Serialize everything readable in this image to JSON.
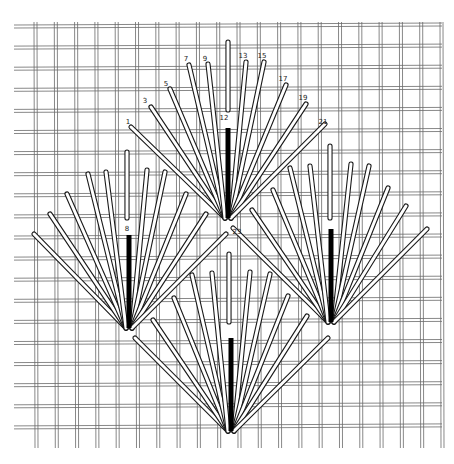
{
  "diagram": {
    "type": "needlepoint-fan-stitch",
    "colors": {
      "canvas": "#ffffff",
      "mesh": "#6a6a6a",
      "stitch_outline": "#1a1a1a",
      "stitch_fill": "#ffffff",
      "center_bar": "#000000"
    },
    "labels": [
      {
        "text": "1",
        "x": 128,
        "y": 124
      },
      {
        "text": "3",
        "x": 145,
        "y": 103
      },
      {
        "text": "5",
        "x": 166,
        "y": 86
      },
      {
        "text": "7",
        "x": 186,
        "y": 61
      },
      {
        "text": "9",
        "x": 205,
        "y": 61
      },
      {
        "text": "12",
        "x": 224,
        "y": 120
      },
      {
        "text": "13",
        "x": 243,
        "y": 58
      },
      {
        "text": "15",
        "x": 262,
        "y": 58
      },
      {
        "text": "17",
        "x": 283,
        "y": 81
      },
      {
        "text": "19",
        "x": 303,
        "y": 100
      },
      {
        "text": "21",
        "x": 323,
        "y": 124
      },
      {
        "text": "8",
        "x": 127,
        "y": 231
      },
      {
        "text": "23",
        "x": 237,
        "y": 234
      }
    ],
    "fans": [
      {
        "name": "top-fan",
        "base": [
          228,
          220
        ],
        "white_vertical": [
          [
            228,
            42
          ],
          [
            228,
            110
          ]
        ],
        "center_bar": [
          [
            228,
            128
          ],
          [
            228,
            218
          ]
        ],
        "tops": [
          [
            131,
            127
          ],
          [
            151,
            107
          ],
          [
            170,
            89
          ],
          [
            189,
            65
          ],
          [
            208,
            64
          ],
          [
            246,
            62
          ],
          [
            264,
            62
          ],
          [
            286,
            85
          ],
          [
            306,
            104
          ],
          [
            325,
            124
          ]
        ]
      },
      {
        "name": "left-fan",
        "base": [
          129,
          330
        ],
        "white_vertical": [
          [
            127,
            152
          ],
          [
            127,
            218
          ]
        ],
        "center_bar": [
          [
            129,
            235
          ],
          [
            129,
            328
          ]
        ],
        "tops": [
          [
            34,
            234
          ],
          [
            50,
            214
          ],
          [
            67,
            194
          ],
          [
            88,
            174
          ],
          [
            106,
            172
          ],
          [
            147,
            170
          ],
          [
            165,
            172
          ],
          [
            186,
            194
          ],
          [
            206,
            214
          ],
          [
            226,
            234
          ]
        ]
      },
      {
        "name": "right-fan",
        "base": [
          331,
          324
        ],
        "white_vertical": [
          [
            330,
            146
          ],
          [
            330,
            218
          ]
        ],
        "center_bar": [
          [
            331,
            229
          ],
          [
            331,
            322
          ]
        ],
        "tops": [
          [
            233,
            228
          ],
          [
            252,
            210
          ],
          [
            273,
            190
          ],
          [
            290,
            168
          ],
          [
            310,
            166
          ],
          [
            351,
            164
          ],
          [
            369,
            166
          ],
          [
            388,
            188
          ],
          [
            406,
            206
          ],
          [
            427,
            229
          ]
        ]
      },
      {
        "name": "bottom-fan",
        "base": [
          231,
          433
        ],
        "white_vertical": [
          [
            229,
            254
          ],
          [
            229,
            322
          ]
        ],
        "center_bar": [
          [
            231,
            338
          ],
          [
            231,
            431
          ]
        ],
        "tops": [
          [
            135,
            338
          ],
          [
            153,
            320
          ],
          [
            174,
            298
          ],
          [
            192,
            275
          ],
          [
            212,
            273
          ],
          [
            250,
            272
          ],
          [
            270,
            274
          ],
          [
            288,
            296
          ],
          [
            307,
            316
          ],
          [
            328,
            338
          ]
        ]
      }
    ]
  }
}
